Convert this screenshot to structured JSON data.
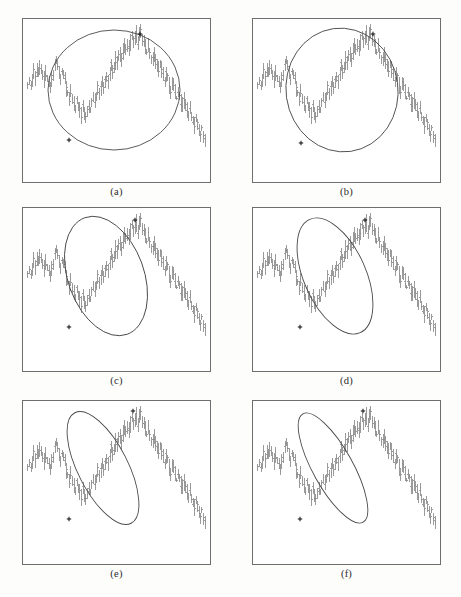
{
  "figure": {
    "kind": "multi-panel-ohlc-figure",
    "background_color": "#fdfdfb",
    "panel_background": "#ffffff",
    "panel_border_color": "#6e6e6e",
    "bar_color": "#8a8a8a",
    "ellipse_color": "#4a4a4a",
    "marker_color": "#1a1a1a",
    "panel_count": 6,
    "columns": 2,
    "rows": 3
  },
  "panels": [
    {
      "id": "a",
      "label": "(a)",
      "ellipse": {
        "cx": 92,
        "cy": 72,
        "rx": 66,
        "ry": 60,
        "rotation": 0
      },
      "markers": [
        {
          "x": 118,
          "y": 16
        },
        {
          "x": 47,
          "y": 122
        }
      ]
    },
    {
      "id": "b",
      "label": "(b)",
      "ellipse": {
        "cx": 90,
        "cy": 72,
        "rx": 56,
        "ry": 62,
        "rotation": -8
      },
      "markers": [
        {
          "x": 121,
          "y": 16
        },
        {
          "x": 49,
          "y": 125
        }
      ]
    },
    {
      "id": "c",
      "label": "(c)",
      "ellipse": {
        "cx": 84,
        "cy": 69,
        "rx": 38,
        "ry": 62,
        "rotation": -20
      },
      "markers": [
        {
          "x": 113,
          "y": 13
        },
        {
          "x": 47,
          "y": 120
        }
      ]
    },
    {
      "id": "d",
      "label": "(d)",
      "ellipse": {
        "cx": 83,
        "cy": 69,
        "rx": 31,
        "ry": 62,
        "rotation": -24
      },
      "markers": [
        {
          "x": 113,
          "y": 13
        },
        {
          "x": 48,
          "y": 120
        }
      ]
    },
    {
      "id": "e",
      "label": "(e)",
      "ellipse": {
        "cx": 81,
        "cy": 68,
        "rx": 25,
        "ry": 62,
        "rotation": -27
      },
      "markers": [
        {
          "x": 111,
          "y": 11
        },
        {
          "x": 47,
          "y": 119
        }
      ]
    },
    {
      "id": "f",
      "label": "(f)",
      "ellipse": {
        "cx": 81,
        "cy": 68,
        "rx": 20,
        "ry": 62,
        "rotation": -29
      },
      "markers": [
        {
          "x": 111,
          "y": 11
        },
        {
          "x": 48,
          "y": 119
        }
      ]
    }
  ],
  "chart_data": {
    "type": "bar",
    "title": "",
    "subtitle": "",
    "xlabel": "",
    "ylabel": "",
    "grid": false,
    "legend": null,
    "series_description": "Daily high-low price bars (OHLC vertical range bars) showing a rounding-top formation: sideways start, pullback, sustained advance to a peak near the middle-right, followed by a prolonged decline to the lowest level at the right edge.",
    "bar_count": 120,
    "ylim": [
      0,
      100
    ],
    "xlim": [
      0,
      119
    ],
    "x": [
      0,
      1,
      2,
      3,
      4,
      5,
      6,
      7,
      8,
      9,
      10,
      11,
      12,
      13,
      14,
      15,
      16,
      17,
      18,
      19,
      20,
      21,
      22,
      23,
      24,
      25,
      26,
      27,
      28,
      29,
      30,
      31,
      32,
      33,
      34,
      35,
      36,
      37,
      38,
      39,
      40,
      41,
      42,
      43,
      44,
      45,
      46,
      47,
      48,
      49,
      50,
      51,
      52,
      53,
      54,
      55,
      56,
      57,
      58,
      59,
      60,
      61,
      62,
      63,
      64,
      65,
      66,
      67,
      68,
      69,
      70,
      71,
      72,
      73,
      74,
      75,
      76,
      77,
      78,
      79,
      80,
      81,
      82,
      83,
      84,
      85,
      86,
      87,
      88,
      89,
      90,
      91,
      92,
      93,
      94,
      95,
      96,
      97,
      98,
      99,
      100,
      101,
      102,
      103,
      104,
      105,
      106,
      107,
      108,
      109,
      110,
      111,
      112,
      113,
      114,
      115,
      116,
      117,
      118,
      119
    ],
    "series": [
      {
        "name": "high",
        "values": [
          64,
          67,
          63,
          68,
          72,
          69,
          74,
          71,
          76,
          73,
          70,
          67,
          71,
          68,
          64,
          61,
          66,
          70,
          75,
          79,
          76,
          72,
          69,
          73,
          70,
          66,
          62,
          58,
          55,
          59,
          56,
          52,
          49,
          53,
          50,
          47,
          44,
          48,
          45,
          42,
          46,
          50,
          47,
          51,
          55,
          52,
          56,
          60,
          57,
          61,
          65,
          62,
          66,
          70,
          67,
          71,
          75,
          72,
          76,
          80,
          77,
          81,
          85,
          82,
          86,
          90,
          87,
          91,
          88,
          92,
          95,
          91,
          94,
          97,
          93,
          96,
          99,
          95,
          92,
          88,
          85,
          89,
          86,
          82,
          79,
          83,
          80,
          76,
          73,
          77,
          74,
          70,
          67,
          71,
          68,
          64,
          61,
          65,
          62,
          58,
          55,
          59,
          56,
          52,
          49,
          53,
          50,
          46,
          43,
          47,
          44,
          40,
          37,
          41,
          38,
          34,
          31,
          35,
          30,
          26
        ]
      },
      {
        "name": "low",
        "values": [
          56,
          59,
          55,
          60,
          64,
          61,
          66,
          63,
          68,
          65,
          62,
          59,
          63,
          60,
          56,
          53,
          58,
          62,
          67,
          71,
          68,
          64,
          61,
          65,
          62,
          58,
          54,
          50,
          47,
          51,
          48,
          44,
          41,
          45,
          42,
          39,
          36,
          40,
          37,
          34,
          38,
          42,
          39,
          43,
          47,
          44,
          48,
          52,
          49,
          53,
          57,
          54,
          58,
          62,
          59,
          63,
          67,
          64,
          68,
          72,
          69,
          73,
          77,
          74,
          78,
          82,
          79,
          83,
          80,
          84,
          87,
          83,
          86,
          89,
          85,
          88,
          91,
          87,
          84,
          80,
          77,
          81,
          78,
          74,
          71,
          75,
          72,
          68,
          65,
          69,
          66,
          62,
          59,
          63,
          60,
          56,
          53,
          57,
          54,
          50,
          47,
          51,
          48,
          44,
          41,
          45,
          42,
          38,
          35,
          39,
          36,
          32,
          29,
          33,
          30,
          26,
          23,
          27,
          22,
          18
        ]
      }
    ]
  }
}
